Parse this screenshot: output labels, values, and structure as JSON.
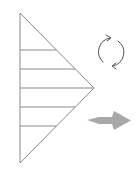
{
  "diagram": {
    "description": "Triangle divided into horizontal strips, rotation symbol, and rightward arrow",
    "colors": {
      "background": "#ffffff",
      "stroke": "#8a8a8a",
      "rotation_stroke": "#555555",
      "arrow_fill": "#a9a9a9"
    },
    "triangle": {
      "top": [
        20,
        13
      ],
      "apex": [
        94,
        88
      ],
      "bottom": [
        20,
        163
      ],
      "strip_lines_y": [
        50,
        69,
        88,
        107,
        126
      ]
    },
    "rotation_icon": {
      "name": "rotate-cycle-icon",
      "center": [
        110,
        52
      ],
      "radius": 14
    },
    "arrow": {
      "name": "arrow-right-icon",
      "direction": "right",
      "bbox": [
        87,
        111,
        131,
        130
      ]
    }
  }
}
